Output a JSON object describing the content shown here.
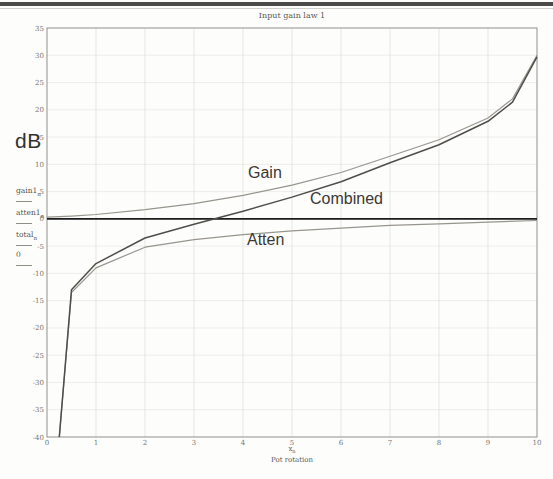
{
  "chart": {
    "title": "Input gain law 1",
    "y_unit": "dB",
    "x_caption": "Pot rotation",
    "x_expr_base": "x",
    "x_expr_sub": "n",
    "curve_labels": {
      "gain": "Gain",
      "combined": "Combined",
      "atten": "Atten"
    }
  },
  "axis_exprs": [
    {
      "base": "gain1",
      "sub": "n"
    },
    {
      "base": "atten1",
      "sub": "n"
    },
    {
      "base": "total",
      "sub": "n"
    },
    {
      "base": "0",
      "sub": ""
    }
  ],
  "colors": {
    "header_rule": "#4a4a4a",
    "border": "#909090",
    "grid_vertical": "#dcdcd6",
    "grid_horizontal": "#e8e7e2",
    "zero_line": "#1d1d1d",
    "combined_curve": "#504e49",
    "gain_curve": "#97958d",
    "atten_curve": "#97958d",
    "tick_text": "#777670",
    "label_text": "#3a3834"
  },
  "chart_data": {
    "type": "line",
    "title": "Input gain law 1",
    "xlabel": "Pot rotation",
    "ylabel": "dB",
    "xlim": [
      0,
      10
    ],
    "ylim": [
      -40,
      35
    ],
    "xticks": [
      0,
      1,
      2,
      3,
      4,
      5,
      6,
      7,
      8,
      9,
      10
    ],
    "ytick_min": -40,
    "ytick_max": 35,
    "ytick_step": 5,
    "grid": true,
    "legend_position": "inline-annotations",
    "series": [
      {
        "name": "gain1",
        "label": "Gain",
        "color": "#97958d",
        "width": 1.2,
        "x": [
          0,
          0.5,
          1,
          2,
          3,
          4,
          5,
          6,
          7,
          8,
          9,
          9.5,
          10
        ],
        "y": [
          0.3,
          0.5,
          0.8,
          1.7,
          2.8,
          4.3,
          6.2,
          8.5,
          11.5,
          14.5,
          18.5,
          22,
          30
        ]
      },
      {
        "name": "atten1",
        "label": "Atten",
        "color": "#97958d",
        "width": 1.2,
        "x": [
          0.25,
          0.5,
          1,
          2,
          3,
          4,
          5,
          6,
          7,
          8,
          9,
          10
        ],
        "y": [
          -40,
          -13.5,
          -9,
          -5.2,
          -3.8,
          -2.9,
          -2.2,
          -1.7,
          -1.2,
          -0.9,
          -0.6,
          -0.3
        ]
      },
      {
        "name": "zero",
        "label": "0",
        "color": "#1d1d1d",
        "width": 1.7,
        "x": [
          0,
          10
        ],
        "y": [
          0,
          0
        ]
      },
      {
        "name": "total",
        "label": "Combined",
        "color": "#504e49",
        "width": 1.5,
        "x": [
          0.25,
          0.5,
          1,
          2,
          3,
          4,
          5,
          6,
          7,
          8,
          9,
          9.5,
          10
        ],
        "y": [
          -40,
          -13,
          -8.2,
          -3.5,
          -1.0,
          1.4,
          4.0,
          6.8,
          10.3,
          13.6,
          17.9,
          21.4,
          29.7
        ]
      }
    ]
  }
}
